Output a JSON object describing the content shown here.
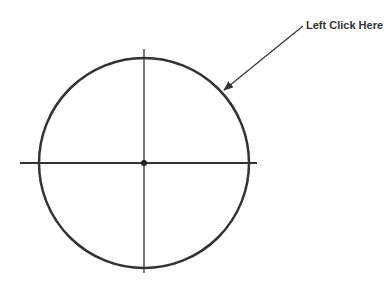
{
  "annotation": {
    "label": "Left Click Here"
  },
  "colors": {
    "stroke": "#333333",
    "background": "#ffffff"
  },
  "geometry": {
    "circle": {
      "cx": 144,
      "cy": 163,
      "r": 105
    },
    "horizontal_line": {
      "x1": 20,
      "y1": 163,
      "x2": 257,
      "y2": 163
    },
    "vertical_line": {
      "x1": 144,
      "y1": 49,
      "x2": 144,
      "y2": 273
    },
    "arrow": {
      "x1": 303,
      "y1": 26,
      "x2": 223,
      "y2": 91
    }
  }
}
